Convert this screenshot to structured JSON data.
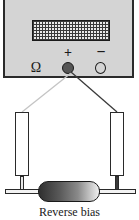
{
  "meter": {
    "ohm_symbol": "Ω",
    "positive_symbol": "+",
    "negative_symbol": "−",
    "display_value": ""
  },
  "leads": {
    "positive_lead_color": "#3a3a3a",
    "negative_lead_color": "#bdbdbd"
  },
  "diode": {
    "cathode_color": "#2f2f2f",
    "anode_color": "#f0f0f0"
  },
  "caption": "Reverse bias"
}
